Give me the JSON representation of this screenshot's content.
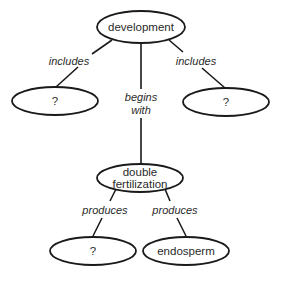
{
  "diagram": {
    "type": "concept-map",
    "nodes": {
      "development": {
        "label": "development"
      },
      "includes_left": {
        "label": "?"
      },
      "includes_right": {
        "label": "?"
      },
      "double_fertilization": {
        "line1": "double",
        "line2": "fertilization"
      },
      "produces_left": {
        "label": "?"
      },
      "endosperm": {
        "label": "endosperm"
      }
    },
    "edges": {
      "dev_to_left": {
        "label": "includes"
      },
      "dev_to_right": {
        "label": "includes"
      },
      "dev_to_double": {
        "line1": "begins",
        "line2": "with"
      },
      "double_to_left": {
        "label": "produces"
      },
      "double_to_endosperm": {
        "label": "produces"
      }
    },
    "colors": {
      "stroke": "#1a1a1a",
      "text": "#2a2a2a",
      "background": "#ffffff"
    }
  }
}
